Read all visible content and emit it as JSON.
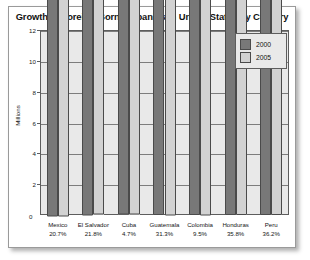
{
  "chart_data": {
    "type": "bar",
    "title": "Growth of Foreign-Born Hispanics in United States by Country",
    "xlabel": "",
    "ylabel": "Millions",
    "ylim": [
      0,
      12
    ],
    "yticks": [
      0,
      2,
      4,
      6,
      8,
      10,
      12
    ],
    "ytick_labels": [
      "0",
      "2",
      "4",
      "6",
      "8",
      "10",
      "12"
    ],
    "grid": true,
    "legend_position": "top-right",
    "categories": [
      "Mexico",
      "El Salvador",
      "Cuba",
      "Guatemala",
      "Colombia",
      "Honduras",
      "Peru"
    ],
    "category_percents": [
      "20.7%",
      "21.8%",
      "4.7%",
      "31.3%",
      "9.5%",
      "35.8%",
      "36.2%"
    ],
    "series": [
      {
        "name": "2000",
        "color": "#787878",
        "values": [
          9062208,
          817614,
          855304,
          516570,
          507955,
          278694,
          272904
        ],
        "labels": [
          "9,062,208",
          "817,614",
          "855,304",
          "516,570",
          "507,955",
          "278,694",
          "272,904"
        ]
      },
      {
        "name": "2005",
        "color": "#d2d2d2",
        "values": [
          10969041,
          987499,
          895041,
          678570,
          556403,
          378668,
          371718
        ],
        "labels": [
          "10,969,041",
          "987,499",
          "895,041",
          "678,570",
          "556,403",
          "378,668",
          "371,718"
        ]
      }
    ]
  },
  "legend": {
    "items": [
      {
        "label": "2000",
        "color": "#787878"
      },
      {
        "label": "2005",
        "color": "#d2d2d2"
      }
    ]
  }
}
